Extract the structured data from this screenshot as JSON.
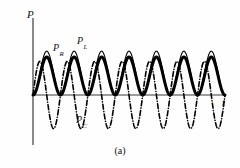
{
  "figure": {
    "caption": "(a)",
    "background_color": "#fefefe",
    "ink_color": "#111111"
  },
  "axes": {
    "y_label": "P",
    "x_label": "t",
    "y_axis_x_px": 33,
    "y_axis_top_px": 18,
    "y_axis_bottom_px": 145,
    "x_axis_y_px": 95,
    "x_axis_left_px": 33,
    "x_axis_right_px": 225,
    "axis_color": "#3b3b3b"
  },
  "labels": {
    "pr_base": "P",
    "pr_sub": "R",
    "pl_base": "P",
    "pl_sub": "L",
    "pc_base": "P",
    "pc_sub": "C",
    "p_axis": "P",
    "t_axis": "t"
  },
  "chart_data": {
    "type": "line",
    "title": "",
    "subtitle": "",
    "xlabel": "t",
    "ylabel": "P",
    "grid": false,
    "legend": "inline-annotations",
    "xlim": [
      0,
      7
    ],
    "ylim": [
      -1.15,
      1.15
    ],
    "x_tick_labels": [],
    "y_tick_labels": [],
    "cycles": 7,
    "annotations": [
      {
        "text": "P_R",
        "x": 0.62,
        "y": 0.78
      },
      {
        "text": "P_L",
        "x": 1.52,
        "y": 1.02
      },
      {
        "text": "P_C",
        "x": 1.5,
        "y": -0.72
      },
      {
        "text": "(a)",
        "x": 3.5,
        "y": -1.55
      }
    ],
    "series": [
      {
        "name": "P_R",
        "label": "P_R",
        "style": "solid-thick",
        "line_width": 3.0,
        "color": "#000000",
        "form": "raised-sine",
        "amplitude": 0.52,
        "offset": 0.52,
        "phase_deg": 0,
        "description": "Instantaneous power in resistor: always non-negative, p = P(1 - cos 2wt)",
        "x": [
          0,
          0.25,
          0.5,
          0.75,
          1,
          1.25,
          1.5,
          1.75,
          2,
          2.25,
          2.5,
          2.75,
          3,
          3.25,
          3.5,
          3.75,
          4,
          4.25,
          4.5,
          4.75,
          5,
          5.25,
          5.5,
          5.75,
          6,
          6.25,
          6.5,
          6.75,
          7
        ],
        "values": [
          0,
          0.52,
          1.04,
          0.52,
          0,
          0.52,
          1.04,
          0.52,
          0,
          0.52,
          1.04,
          0.52,
          0,
          0.52,
          1.04,
          0.52,
          0,
          0.52,
          1.04,
          0.52,
          0,
          0.52,
          1.04,
          0.52,
          0,
          0.52,
          1.04,
          0.52,
          0
        ]
      },
      {
        "name": "P_L",
        "label": "P_L",
        "style": "solid-thin",
        "line_width": 1.1,
        "color": "#000000",
        "form": "raised-sine",
        "amplitude": 0.6,
        "offset": 0.6,
        "phase_deg": 0,
        "description": "Instantaneous power in inductor envelope, slightly larger peak than P_R",
        "x": [
          0,
          0.25,
          0.5,
          0.75,
          1,
          1.25,
          1.5,
          1.75,
          2,
          2.25,
          2.5,
          2.75,
          3,
          3.25,
          3.5,
          3.75,
          4,
          4.25,
          4.5,
          4.75,
          5,
          5.25,
          5.5,
          5.75,
          6,
          6.25,
          6.5,
          6.75,
          7
        ],
        "values": [
          0,
          0.6,
          1.2,
          0.6,
          0,
          0.6,
          1.2,
          0.6,
          0,
          0.6,
          1.2,
          0.6,
          0,
          0.6,
          1.2,
          0.6,
          0,
          0.6,
          1.2,
          0.6,
          0,
          0.6,
          1.2,
          0.6,
          0,
          0.6,
          1.2,
          0.6,
          0
        ]
      },
      {
        "name": "P_C",
        "label": "P_C",
        "style": "dash-dot",
        "line_width": 1.6,
        "color": "#000000",
        "form": "pure-sine",
        "amplitude": 0.92,
        "offset": 0,
        "phase_deg": 0,
        "description": "Instantaneous power in capacitor: symmetric about the t axis, alternately positive and negative",
        "x": [
          0,
          0.25,
          0.5,
          0.75,
          1,
          1.25,
          1.5,
          1.75,
          2,
          2.25,
          2.5,
          2.75,
          3,
          3.25,
          3.5,
          3.75,
          4,
          4.25,
          4.5,
          4.75,
          5,
          5.25,
          5.5,
          5.75,
          6,
          6.25,
          6.5,
          6.75,
          7
        ],
        "values": [
          0,
          0.65,
          0.92,
          0.65,
          0,
          -0.65,
          -0.92,
          -0.65,
          0,
          0.65,
          0.92,
          0.65,
          0,
          -0.65,
          -0.92,
          -0.65,
          0,
          0.65,
          0.92,
          0.65,
          0,
          -0.65,
          -0.92,
          -0.65,
          0,
          0.65,
          0.92,
          0.65,
          0
        ]
      }
    ]
  }
}
